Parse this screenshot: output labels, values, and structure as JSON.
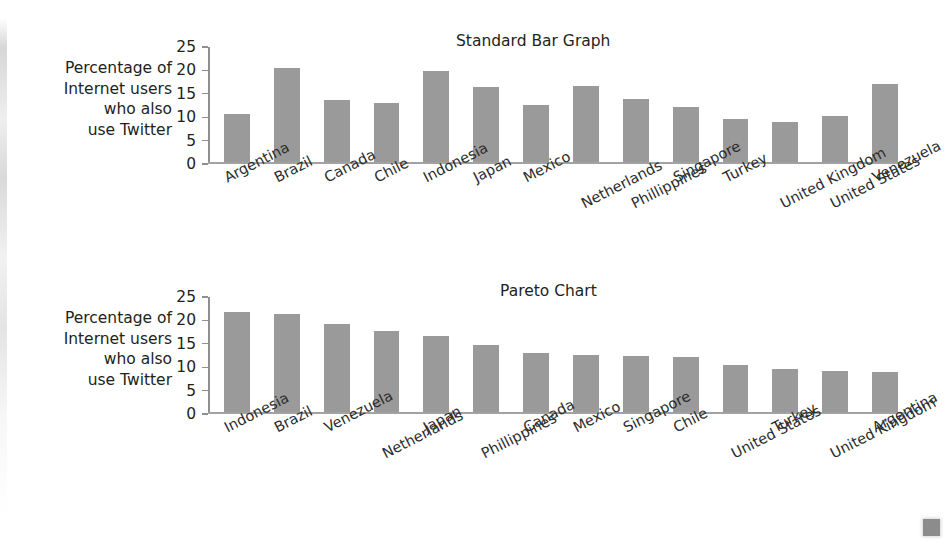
{
  "figure": {
    "axis_label": "Percentage of\nInternet users\nwho also\nuse Twitter",
    "y_ticks": [
      "25",
      "20",
      "15",
      "10",
      "5",
      "0"
    ]
  },
  "chart_data": [
    {
      "type": "bar",
      "title": "Standard Bar Graph",
      "xlabel": "",
      "ylabel": "Percentage of Internet users who also use Twitter",
      "ylim": [
        0,
        25
      ],
      "yticks": [
        0,
        5,
        10,
        15,
        20,
        25
      ],
      "grid": false,
      "legend": "none",
      "categories": [
        "Argentina",
        "Brazil",
        "Canada",
        "Chile",
        "Indonesia",
        "Japan",
        "Mexico",
        "Netherlands",
        "Phillippines",
        "Singapore",
        "Turkey",
        "United Kingdom",
        "United States",
        "Venezuela"
      ],
      "values": [
        10.3,
        20.2,
        13.4,
        12.6,
        19.6,
        16.2,
        12.3,
        16.4,
        13.6,
        11.8,
        9.3,
        8.7,
        10.0,
        16.8
      ]
    },
    {
      "type": "bar",
      "title": "Pareto Chart",
      "xlabel": "",
      "ylabel": "Percentage of Internet users who also use Twitter",
      "ylim": [
        0,
        25
      ],
      "yticks": [
        0,
        5,
        10,
        15,
        20,
        25
      ],
      "grid": false,
      "legend": "none",
      "categories": [
        "Indonesia",
        "Brazil",
        "Venezuela",
        "Netherlands",
        "Japan",
        "Phillippines",
        "Canada",
        "Mexico",
        "Singapore",
        "Chile",
        "United States",
        "Turkey",
        "United Kingdom",
        "Argentina"
      ],
      "values": [
        21.4,
        21.0,
        18.8,
        17.3,
        16.4,
        14.3,
        12.7,
        12.3,
        12.0,
        11.8,
        10.2,
        9.3,
        8.9,
        8.7
      ]
    }
  ],
  "colors": {
    "bar_fill": "#9a9a9a",
    "axis": "#8f8f8f",
    "text": "#231f20",
    "background": "#ffffff"
  }
}
